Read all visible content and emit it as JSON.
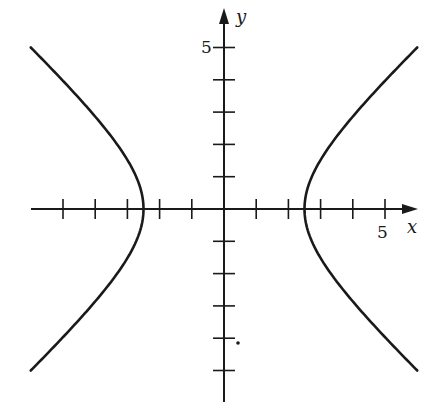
{
  "chart_data": {
    "type": "line",
    "title": "",
    "xlabel": "x",
    "ylabel": "y",
    "xlim": [
      -6,
      6
    ],
    "ylim": [
      -5,
      5
    ],
    "x_tick_step": 1,
    "y_tick_step": 1,
    "x_tick_labels": [
      {
        "value": 5,
        "label": "5"
      }
    ],
    "y_tick_labels": [
      {
        "value": 5,
        "label": "5"
      }
    ],
    "grid": false,
    "legend": null,
    "series": [
      {
        "name": "right branch",
        "equation": "x^2/6.25 - y^2/5.25 = 1",
        "vertex": [
          2.5,
          0
        ],
        "points": [
          [
            6.0,
            5.0
          ],
          [
            4.5,
            3.4
          ],
          [
            3.5,
            2.2
          ],
          [
            3.0,
            1.4
          ],
          [
            2.5,
            0
          ],
          [
            3.0,
            -1.4
          ],
          [
            3.5,
            -2.2
          ],
          [
            4.5,
            -3.4
          ],
          [
            5.9,
            -5.0
          ]
        ]
      },
      {
        "name": "left branch",
        "equation": "x^2/6.25 - y^2/5.25 = 1",
        "vertex": [
          -2.5,
          0
        ],
        "points": [
          [
            -6.0,
            5.0
          ],
          [
            -4.5,
            3.4
          ],
          [
            -3.5,
            2.2
          ],
          [
            -3.0,
            1.4
          ],
          [
            -2.5,
            0
          ],
          [
            -3.0,
            -1.4
          ],
          [
            -3.5,
            -2.2
          ],
          [
            -4.5,
            -3.4
          ],
          [
            -5.9,
            -5.0
          ]
        ]
      }
    ],
    "annotations": [
      {
        "type": "stray-dot",
        "x": 0.45,
        "y": -4.2
      }
    ]
  },
  "axes": {
    "x_label": "x",
    "y_label": "y",
    "x_tick_label": "5",
    "y_tick_label": "5"
  },
  "colors": {
    "ink": "#1a1a1a",
    "background": "#ffffff"
  }
}
